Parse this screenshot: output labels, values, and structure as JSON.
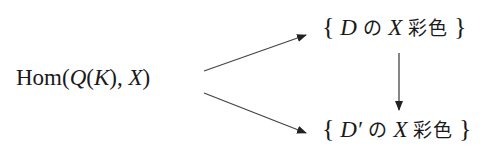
{
  "diagram": {
    "source": {
      "hom": "Hom",
      "open": "(",
      "Q": "Q",
      "open2": "(",
      "K": "K",
      "close2": "),",
      "X": "X",
      "close": ")"
    },
    "top_target": {
      "lbrace": "{",
      "D": "D",
      "no": "の",
      "X": "X",
      "coloring": "彩色",
      "rbrace": "}"
    },
    "bottom_target": {
      "lbrace": "{",
      "D": "D′",
      "no": "の",
      "X": "X",
      "coloring": "彩色",
      "rbrace": "}"
    },
    "arrows": [
      {
        "from": "source",
        "to": "top_target"
      },
      {
        "from": "source",
        "to": "bottom_target"
      },
      {
        "from": "top_target",
        "to": "bottom_target"
      }
    ],
    "stroke_color": "#333333"
  }
}
